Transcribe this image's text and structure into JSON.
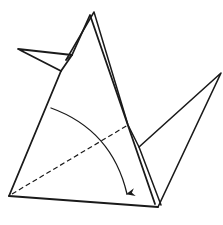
{
  "diagram": {
    "type": "origami-fold-step",
    "stroke_color": "#1a1a1a",
    "background": "#ffffff",
    "stroke_width": 1.6,
    "points": {
      "apex_front": [
        90,
        15
      ],
      "apex_back": [
        94,
        12
      ],
      "head_tip": [
        18,
        49
      ],
      "head_join_top": [
        72,
        55
      ],
      "head_join_bottom": [
        61,
        71
      ],
      "bottom_left": [
        9,
        196
      ],
      "bottom_right": [
        158,
        207
      ],
      "tail_tip": [
        221,
        73
      ],
      "tail_inner_join": [
        139,
        147
      ],
      "arc_start": [
        51,
        108
      ],
      "arrow_tip": [
        127,
        197
      ],
      "dashed_end": [
        128,
        125
      ]
    },
    "elements": [
      {
        "name": "neck-front-edge",
        "kind": "solid"
      },
      {
        "name": "neck-back-edge",
        "kind": "solid"
      },
      {
        "name": "head-flap",
        "kind": "solid"
      },
      {
        "name": "body-base-edge",
        "kind": "solid"
      },
      {
        "name": "body-right-edge",
        "kind": "solid"
      },
      {
        "name": "tail-flap",
        "kind": "solid"
      },
      {
        "name": "valley-fold-line",
        "kind": "dashed"
      },
      {
        "name": "fold-direction-arrow",
        "kind": "arc-arrow"
      }
    ],
    "caption": "Valley fold the flap down along the dashed line, following the arrow."
  }
}
